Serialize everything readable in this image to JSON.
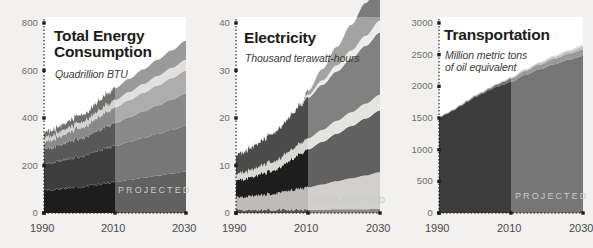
{
  "figure": {
    "background_color": "#f2f1ef",
    "panel_count": 3,
    "projected_label": "PROJECTED",
    "projected_start_year": 2010
  },
  "palette": {
    "band_1_darkest": "#1d1d1d",
    "band_2_dark": "#3d3d3d",
    "band_3_mid": "#585858",
    "band_4_light": "#8a8a8a",
    "band_5_pale": "#c8c8c8",
    "band_6_near_white": "#e9e8e6",
    "band_7_mid_gray": "#767676",
    "projected_overlay": "rgba(255,255,255,0.30)",
    "axis_color": "#1b1b1b",
    "tick_text": "#6d6d6d"
  },
  "chart_data": [
    {
      "type": "area",
      "id": "total-energy-consumption",
      "title": "Total Energy\nConsumption",
      "subtitle": "Quadrillion BTU",
      "xlabel": "",
      "ylabel": "Quadrillion BTU",
      "xlim": [
        1990,
        2030
      ],
      "ylim": [
        0,
        800
      ],
      "xticks": [
        1990,
        2010,
        2030
      ],
      "yticks": [
        0,
        200,
        400,
        600,
        800
      ],
      "ytick_labels": [
        "0",
        "200",
        "400",
        "600",
        "800"
      ],
      "xtick_labels": [
        "1990",
        "2010",
        "2030"
      ],
      "grid": false,
      "legend": "none",
      "stacked": true,
      "x": [
        1990,
        1992,
        1994,
        1996,
        1998,
        2000,
        2002,
        2004,
        2006,
        2008,
        2010,
        2014,
        2018,
        2022,
        2026,
        2030
      ],
      "series": [
        {
          "name": "band-1",
          "color": "#1d1d1d",
          "values": [
            95,
            98,
            101,
            105,
            107,
            110,
            112,
            118,
            122,
            126,
            130,
            139,
            148,
            157,
            166,
            175
          ]
        },
        {
          "name": "band-2",
          "color": "#3d3d3d",
          "values": [
            110,
            112,
            116,
            120,
            123,
            128,
            130,
            136,
            142,
            148,
            152,
            160,
            168,
            176,
            184,
            192
          ]
        },
        {
          "name": "band-3",
          "color": "#585858",
          "values": [
            62,
            64,
            67,
            70,
            73,
            77,
            79,
            83,
            87,
            92,
            96,
            104,
            112,
            120,
            128,
            136
          ]
        },
        {
          "name": "band-4",
          "color": "#8a8a8a",
          "values": [
            30,
            32,
            35,
            38,
            41,
            45,
            47,
            52,
            58,
            62,
            66,
            72,
            78,
            84,
            90,
            96
          ]
        },
        {
          "name": "band-5",
          "color": "#d4d3d0",
          "values": [
            18,
            18,
            19,
            20,
            21,
            22,
            23,
            25,
            27,
            29,
            31,
            34,
            37,
            40,
            43,
            46
          ]
        },
        {
          "name": "band-6",
          "color": "#6f6f6f",
          "values": [
            22,
            23,
            24,
            26,
            28,
            30,
            32,
            36,
            42,
            46,
            50,
            56,
            62,
            68,
            74,
            80
          ]
        }
      ],
      "totals": [
        337,
        347,
        362,
        379,
        393,
        412,
        423,
        450,
        478,
        503,
        525,
        565,
        605,
        645,
        685,
        725
      ]
    },
    {
      "type": "area",
      "id": "electricity",
      "title": "Electricity",
      "subtitle": "Thousand terawatt-hours",
      "xlabel": "",
      "ylabel": "Thousand terawatt-hours",
      "xlim": [
        1990,
        2030
      ],
      "ylim": [
        0,
        40
      ],
      "xticks": [
        1990,
        2010,
        2030
      ],
      "yticks": [
        0,
        10,
        20,
        30,
        40
      ],
      "ytick_labels": [
        "0",
        "10",
        "20",
        "30",
        "40"
      ],
      "xtick_labels": [
        "1990",
        "2010",
        "2030"
      ],
      "grid": false,
      "legend": "none",
      "stacked": true,
      "x": [
        1990,
        1992,
        1994,
        1996,
        1998,
        2000,
        2002,
        2004,
        2006,
        2008,
        2010,
        2014,
        2018,
        2022,
        2026,
        2030
      ],
      "series": [
        {
          "name": "band-0-base",
          "color": "#555555",
          "values": [
            0.7,
            0.7,
            0.7,
            0.7,
            0.7,
            0.7,
            0.7,
            0.7,
            0.7,
            0.7,
            0.7,
            0.7,
            0.8,
            0.8,
            0.8,
            0.9
          ]
        },
        {
          "name": "band-1",
          "color": "#bdbcb9",
          "values": [
            2.5,
            2.6,
            2.8,
            3.0,
            3.1,
            3.3,
            3.5,
            3.8,
            4.1,
            4.4,
            4.7,
            5.3,
            5.9,
            6.5,
            7.1,
            7.7
          ]
        },
        {
          "name": "band-2",
          "color": "#1d1d1d",
          "values": [
            3.6,
            3.8,
            4.0,
            4.3,
            4.6,
            5.0,
            5.3,
            6.0,
            6.7,
            7.4,
            8.0,
            9.0,
            10.0,
            11.0,
            12.0,
            13.0
          ]
        },
        {
          "name": "band-3",
          "color": "#d9d8d5",
          "values": [
            1.3,
            1.4,
            1.5,
            1.6,
            1.7,
            1.8,
            1.9,
            2.0,
            2.1,
            2.2,
            2.3,
            2.5,
            2.7,
            2.9,
            3.1,
            3.3
          ]
        },
        {
          "name": "band-4",
          "color": "#4b4b4b",
          "values": [
            4.0,
            4.3,
            4.6,
            5.0,
            5.4,
            5.9,
            6.3,
            6.9,
            7.5,
            8.1,
            8.6,
            9.5,
            10.4,
            11.3,
            12.2,
            13.1
          ]
        },
        {
          "name": "band-5",
          "color": "#e7e6e3",
          "values": [
            0.0,
            0.0,
            0.0,
            0.0,
            0.0,
            0.0,
            0.0,
            0.0,
            0.0,
            0.0,
            0.5,
            0.9,
            1.3,
            1.7,
            2.1,
            2.5
          ]
        },
        {
          "name": "band-6",
          "color": "#7c7c7c",
          "values": [
            0.0,
            0.0,
            0.0,
            0.0,
            0.0,
            0.0,
            0.0,
            0.0,
            0.0,
            0.0,
            0.9,
            2.4,
            3.9,
            5.4,
            6.9,
            8.4
          ]
        }
      ],
      "totals": [
        12.1,
        12.8,
        13.6,
        14.6,
        15.5,
        16.7,
        17.7,
        19.4,
        21.1,
        22.8,
        25.7,
        30.3,
        35.0,
        39.6,
        44.2,
        48.9
      ]
    },
    {
      "type": "area",
      "id": "transportation",
      "title": "Transportation",
      "subtitle": "Million metric tons\nof oil equivalent",
      "xlabel": "",
      "ylabel": "Million metric tons of oil equivalent",
      "xlim": [
        1990,
        2030
      ],
      "ylim": [
        0,
        3000
      ],
      "xticks": [
        1990,
        2010,
        2030
      ],
      "yticks": [
        0,
        500,
        1000,
        1500,
        2000,
        2500,
        3000
      ],
      "ytick_labels": [
        "0",
        "500",
        "1000",
        "1500",
        "2000",
        "2500",
        "3000"
      ],
      "xtick_labels": [
        "1990",
        "2010",
        "2030"
      ],
      "grid": false,
      "legend": "none",
      "stacked": true,
      "x": [
        1990,
        1992,
        1994,
        1996,
        1998,
        2000,
        2002,
        2004,
        2006,
        2008,
        2010,
        2014,
        2018,
        2022,
        2026,
        2030
      ],
      "series": [
        {
          "name": "band-main-oil",
          "color": "#3c3c3c",
          "values": [
            1500,
            1560,
            1620,
            1690,
            1760,
            1830,
            1880,
            1940,
            1990,
            2030,
            2075,
            2180,
            2270,
            2350,
            2420,
            2480
          ]
        },
        {
          "name": "band-biofuel",
          "color": "#6e6e6e",
          "values": [
            8,
            9,
            10,
            12,
            14,
            17,
            20,
            25,
            32,
            40,
            48,
            62,
            74,
            84,
            92,
            100
          ]
        },
        {
          "name": "band-gas",
          "color": "#a0a09d",
          "values": [
            4,
            4,
            5,
            5,
            6,
            7,
            8,
            9,
            11,
            13,
            15,
            20,
            26,
            32,
            38,
            44
          ]
        },
        {
          "name": "band-electric",
          "color": "#cfcecb",
          "values": [
            2,
            2,
            2,
            2,
            3,
            3,
            3,
            4,
            5,
            6,
            7,
            10,
            14,
            19,
            24,
            30
          ]
        }
      ],
      "totals": [
        1514,
        1575,
        1637,
        1709,
        1783,
        1857,
        1911,
        1978,
        2038,
        2089,
        2145,
        2272,
        2384,
        2485,
        2574,
        2654
      ]
    }
  ]
}
